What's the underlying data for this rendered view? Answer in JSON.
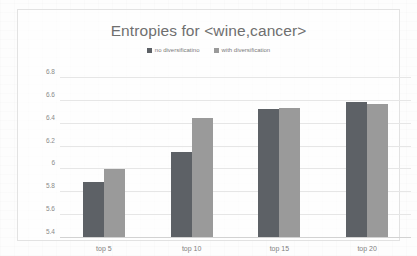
{
  "chart_data": {
    "type": "bar",
    "title": "Entropies for <wine,cancer>",
    "xlabel": "",
    "ylabel": "",
    "categories": [
      "top 5",
      "top 10",
      "top 15",
      "top 20"
    ],
    "series": [
      {
        "name": "no diversificatino",
        "color": "#5d6166",
        "values": [
          5.89,
          6.15,
          6.53,
          6.59
        ]
      },
      {
        "name": "with diversification",
        "color": "#9a9a9a",
        "values": [
          6.0,
          6.45,
          6.54,
          6.57
        ]
      }
    ],
    "ylim": [
      5.4,
      6.8
    ],
    "yticks": [
      "5.4",
      "5.6",
      "5.8",
      "6",
      "6.2",
      "6.4",
      "6.6",
      "6.8"
    ],
    "ytick_values": [
      5.4,
      5.6,
      5.8,
      6.0,
      6.2,
      6.4,
      6.6,
      6.8
    ],
    "grid": true,
    "legend_position": "top-center"
  }
}
